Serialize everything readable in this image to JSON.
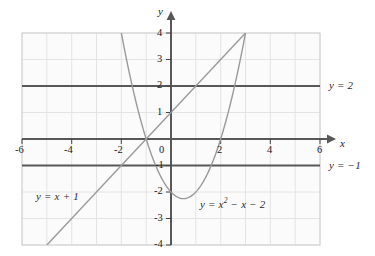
{
  "figure": {
    "title": "",
    "background_color": "#ffffff",
    "grid_color": "#e2e2e2",
    "grid_border_color": "#cccccc",
    "axis_color": "#555555",
    "curve_color": "#9a9a9a",
    "text_color": "#1a1a1a"
  },
  "axes": {
    "x_name": "x",
    "y_name": "y",
    "x_min": -6,
    "x_max": 6,
    "y_min": -4,
    "y_max": 4,
    "x_tick_labels": [
      "-6",
      "-4",
      "-2",
      "0",
      "2",
      "4",
      "6"
    ],
    "x_tick_values": [
      -6,
      -4,
      -2,
      0,
      2,
      4,
      6
    ],
    "y_tick_labels": [
      "4",
      "3",
      "2",
      "1",
      "-1",
      "-2",
      "-3",
      "-4"
    ],
    "y_tick_values": [
      4,
      3,
      2,
      1,
      -1,
      -2,
      -3,
      -4
    ],
    "grid": "on",
    "grid_step": 1
  },
  "labels": {
    "line_eq": "y = x + 1",
    "parabola_eq_pre": "y = x",
    "parabola_eq_exp": "2",
    "parabola_eq_post": " − x − 2",
    "hline_top": "y = 2",
    "hline_bottom": "y = −1"
  },
  "chart_data": {
    "type": "line",
    "title": "",
    "xlabel": "x",
    "ylabel": "y",
    "xlim": [
      -6,
      6
    ],
    "ylim": [
      -4,
      4
    ],
    "grid": true,
    "legend": "inline-annotations",
    "series": [
      {
        "name": "y = x + 1",
        "kind": "linear",
        "equation": "y = x + 1",
        "slope": 1,
        "intercept": 1,
        "x_range": [
          -5,
          3
        ],
        "points": [
          {
            "x": -5,
            "y": -4
          },
          {
            "x": -4,
            "y": -3
          },
          {
            "x": -3,
            "y": -2
          },
          {
            "x": -2,
            "y": -1
          },
          {
            "x": -1,
            "y": 0
          },
          {
            "x": 0,
            "y": 1
          },
          {
            "x": 1,
            "y": 2
          },
          {
            "x": 2,
            "y": 3
          },
          {
            "x": 3,
            "y": 4
          }
        ]
      },
      {
        "name": "y = x^2 - x - 2",
        "kind": "quadratic",
        "equation": "y = x² − x − 2",
        "a": 1,
        "b": -1,
        "c": -2,
        "vertex": {
          "x": 0.5,
          "y": -2.25
        },
        "roots": [
          -1,
          2
        ],
        "x_range": [
          -2,
          3
        ],
        "points": [
          {
            "x": -2,
            "y": 4
          },
          {
            "x": -1.5,
            "y": 1.75
          },
          {
            "x": -1,
            "y": 0
          },
          {
            "x": -0.5,
            "y": -1.25
          },
          {
            "x": 0,
            "y": -2
          },
          {
            "x": 0.5,
            "y": -2.25
          },
          {
            "x": 1,
            "y": -2
          },
          {
            "x": 1.5,
            "y": -1.25
          },
          {
            "x": 2,
            "y": 0
          },
          {
            "x": 2.5,
            "y": 1.75
          },
          {
            "x": 3,
            "y": 4
          }
        ]
      },
      {
        "name": "y = 2",
        "kind": "horizontal",
        "equation": "y = 2",
        "y_value": 2,
        "x_range": [
          -6,
          6
        ]
      },
      {
        "name": "y = -1",
        "kind": "horizontal",
        "equation": "y = −1",
        "y_value": -1,
        "x_range": [
          -6,
          6
        ]
      }
    ]
  }
}
